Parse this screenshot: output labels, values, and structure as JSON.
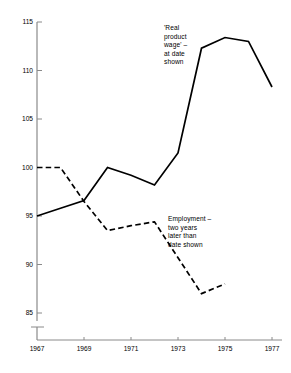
{
  "chart_data": {
    "type": "line",
    "title": "",
    "subtitle": "",
    "xlabel": "",
    "ylabel": "",
    "xlim": [
      1967,
      1977
    ],
    "ylim": [
      84.2,
      115
    ],
    "grid": false,
    "legend_position": "inline-annotations",
    "y_axis_break": true,
    "y_break_note": "axis broken below 85",
    "yticks": [
      {
        "value": 115,
        "label": "115"
      },
      {
        "value": 110,
        "label": "110"
      },
      {
        "value": 105,
        "label": "105"
      },
      {
        "value": 100,
        "label": "100"
      },
      {
        "value": 95,
        "label": "95"
      },
      {
        "value": 90,
        "label": "90"
      },
      {
        "value": 85,
        "label": "85"
      }
    ],
    "xticks": [
      {
        "value": 1967,
        "label": "1967"
      },
      {
        "value": 1969,
        "label": "1969"
      },
      {
        "value": 1971,
        "label": "1971"
      },
      {
        "value": 1973,
        "label": "1973"
      },
      {
        "value": 1975,
        "label": "1975"
      },
      {
        "value": 1977,
        "label": "1977"
      }
    ],
    "series": [
      {
        "name": "'Real product wage' – at date shown",
        "style": "solid",
        "color": "#000000",
        "x": [
          1967,
          1968,
          1969,
          1970,
          1971,
          1972,
          1973,
          1974,
          1975,
          1976,
          1977
        ],
        "values": [
          95.0,
          95.8,
          96.6,
          100.0,
          99.2,
          98.2,
          101.5,
          112.3,
          113.4,
          113.0,
          108.3
        ]
      },
      {
        "name": "Employment – two years later than date shown",
        "style": "dashed",
        "color": "#000000",
        "x": [
          1967,
          1968,
          1969,
          1970,
          1971,
          1972,
          1974,
          1975
        ],
        "values": [
          100.0,
          100.0,
          96.5,
          93.5,
          94.0,
          94.4,
          87.0,
          88.0
        ]
      }
    ],
    "annotations": [
      {
        "id": "wage",
        "text": "'Real\nproduct\nwage' –\nat date\nshown",
        "target_series": "'Real product wage' – at date shown"
      },
      {
        "id": "employment",
        "text": "Employment –\ntwo years\nlater than\ndate shown",
        "target_series": "Employment – two years later than date shown"
      }
    ]
  },
  "axes": {
    "axis_color": "#8a8a8a",
    "line_color": "#111111"
  }
}
